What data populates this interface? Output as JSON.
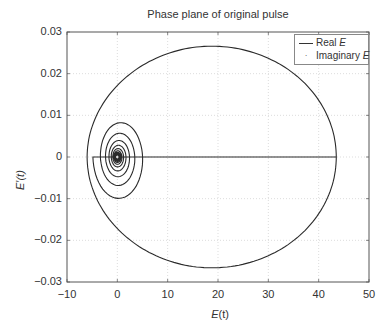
{
  "chart_data": {
    "type": "line",
    "title": "Phase plane of original pulse",
    "xlabel": "E(t)",
    "ylabel": "E'(t)",
    "xlim": [
      -10,
      50
    ],
    "ylim": [
      -0.03,
      0.03
    ],
    "xticks": [
      -10,
      0,
      10,
      20,
      30,
      40,
      50
    ],
    "xtick_labels": [
      "−10",
      "0",
      "10",
      "20",
      "30",
      "40",
      "50"
    ],
    "yticks": [
      0.03,
      0.02,
      0.01,
      0,
      -0.01,
      -0.02,
      -0.03
    ],
    "ytick_labels": [
      "0.03",
      "0.02",
      "0.01",
      "0",
      "−0.01",
      "−0.02",
      "−0.03"
    ],
    "grid": true,
    "legend_position": "upper right",
    "legend": [
      {
        "label": "Real E",
        "style": "line"
      },
      {
        "label": "Imaginary E",
        "style": "dot"
      }
    ],
    "series": [
      {
        "name": "Real E",
        "description": "Large closed loop centered near E=19 spanning E from about -6 to 43.5 and E' from about -0.027 to 0.027, plus a decaying spiral centered at the origin",
        "key_points": [
          {
            "x": 43.5,
            "y": 0
          },
          {
            "x": 20,
            "y": 0.0266
          },
          {
            "x": -6,
            "y": 0
          },
          {
            "x": 20,
            "y": -0.0266
          },
          {
            "x": 3.5,
            "y": 0.006
          },
          {
            "x": -3.8,
            "y": 0
          },
          {
            "x": 0,
            "y": 0
          }
        ]
      },
      {
        "name": "Imaginary E",
        "description": "Points clustered at the origin",
        "key_points": [
          {
            "x": 0,
            "y": 0
          }
        ]
      }
    ]
  },
  "legend": {
    "real_prefix": "Real ",
    "real_var": "E",
    "imag_prefix": "Imaginary ",
    "imag_var": "E",
    "dot_glyph": "·"
  },
  "labels": {
    "xlabel_var": "E",
    "xlabel_arg": "(t)",
    "ylabel_var": "E′",
    "ylabel_arg": "(t)"
  }
}
